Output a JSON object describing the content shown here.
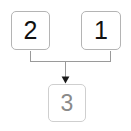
{
  "diagram": {
    "type": "flow-graph",
    "background_color": "#ffffff",
    "nodes": [
      {
        "id": "node-2",
        "label": "2",
        "role": "source",
        "position": "top-left",
        "text_color": "#111111",
        "border_color": "#b4b4b4",
        "fill_color": "#ffffff"
      },
      {
        "id": "node-1",
        "label": "1",
        "role": "source",
        "position": "top-right",
        "text_color": "#111111",
        "border_color": "#b4b4b4",
        "fill_color": "#ffffff"
      },
      {
        "id": "node-3",
        "label": "3",
        "role": "target",
        "position": "bottom-center",
        "text_color": "#8a8a8a",
        "border_color": "#cfcfcf",
        "fill_color": "#ffffff"
      }
    ],
    "edges": [
      {
        "id": "edge-2-to-3",
        "from": "node-2",
        "to": "node-3",
        "style": "orthogonal",
        "color": "#9a9a9a",
        "arrowhead": "filled-triangle"
      },
      {
        "id": "edge-1-to-3",
        "from": "node-1",
        "to": "node-3",
        "style": "orthogonal",
        "color": "#9a9a9a",
        "arrowhead": "filled-triangle"
      }
    ],
    "edge_color": "#9a9a9a",
    "arrow_color": "#1a1a1a"
  }
}
